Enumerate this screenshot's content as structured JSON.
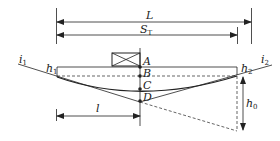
{
  "diagram": {
    "type": "vertical-curve-sight-distance",
    "labels": {
      "L": "L",
      "S": "S",
      "S_sub": "T",
      "i1": "i",
      "i1_sub": "1",
      "i2": "i",
      "i2_sub": "2",
      "h1": "h",
      "h1_sub": "1",
      "h2": "h",
      "h2_sub": "2",
      "h0": "h",
      "h0_sub": "0",
      "l": "l",
      "A": "A",
      "B": "B",
      "C": "C",
      "D": "D"
    },
    "colors": {
      "stroke": "#222222",
      "background": "#ffffff"
    }
  }
}
